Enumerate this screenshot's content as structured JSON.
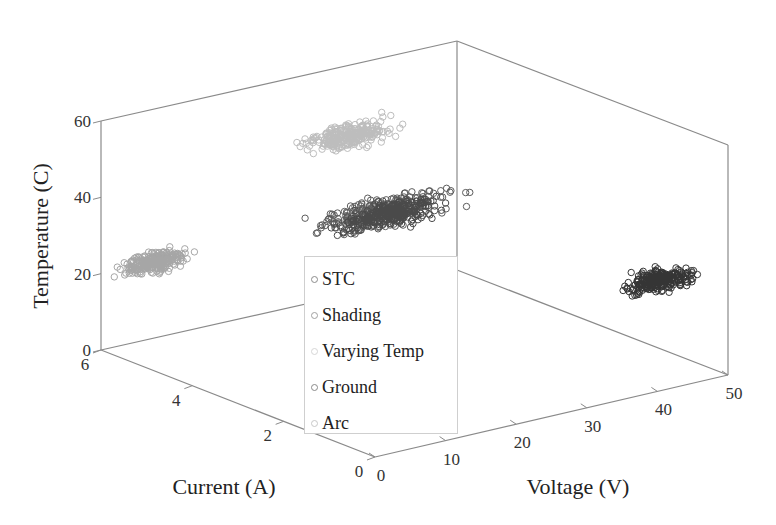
{
  "title_partial": "",
  "chart_data": {
    "type": "scatter3d",
    "title": "",
    "xlabel": "Voltage (V)",
    "ylabel": "Current (A)",
    "zlabel": "Temperature (C)",
    "xlim": [
      0,
      50
    ],
    "ylim": [
      0,
      6
    ],
    "zlim": [
      0,
      60
    ],
    "xticks": [
      "0",
      "10",
      "20",
      "30",
      "40",
      "50"
    ],
    "yticks": [
      "0",
      "2",
      "4",
      "6"
    ],
    "zticks": [
      "0",
      "20",
      "40",
      "60"
    ],
    "legend_position": "center",
    "marker": "open-circle",
    "series": [
      {
        "name": "STC",
        "color": "#5c5c5c",
        "center": {
          "voltage": 35,
          "current": 5.2,
          "temperature": 25
        },
        "spread": {
          "voltage": 8,
          "current": 0.2,
          "temperature": 3
        }
      },
      {
        "name": "Shading",
        "color": "#a6a6a6",
        "center": {
          "voltage": 3,
          "current": 5.3,
          "temperature": 25
        },
        "spread": {
          "voltage": 4,
          "current": 0.15,
          "temperature": 2.5
        }
      },
      {
        "name": "Varying Temp",
        "color": "#bdbdbd",
        "center": {
          "voltage": 30,
          "current": 5.2,
          "temperature": 47
        },
        "spread": {
          "voltage": 6,
          "current": 0.15,
          "temperature": 3
        }
      },
      {
        "name": "Ground",
        "color": "#4a4a4a",
        "center": {
          "voltage": 36,
          "current": 5.2,
          "temperature": 24
        },
        "spread": {
          "voltage": 6,
          "current": 0.15,
          "temperature": 3
        }
      },
      {
        "name": "Arc",
        "color": "#353535",
        "center": {
          "voltage": 48,
          "current": 1.2,
          "temperature": 20
        },
        "spread": {
          "voltage": 4,
          "current": 0.15,
          "temperature": 2.5
        }
      }
    ]
  },
  "legend": {
    "items": [
      {
        "label": "STC",
        "color": "#8c8c8c"
      },
      {
        "label": "Shading",
        "color": "#a0a0a0"
      },
      {
        "label": "Varying Temp",
        "color": "#d6d6d6"
      },
      {
        "label": "Ground",
        "color": "#8a8a8a"
      },
      {
        "label": "Arc",
        "color": "#c8c8c8"
      }
    ]
  },
  "axes": {
    "x_label": "Voltage (V)",
    "y_label": "Current (A)",
    "z_label": "Temperature (C)"
  }
}
